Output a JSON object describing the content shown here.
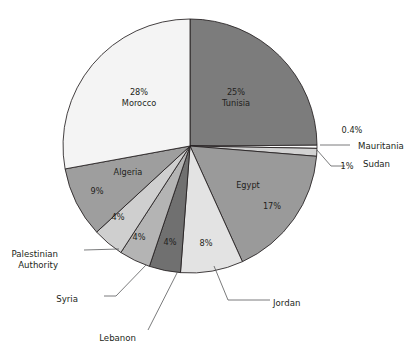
{
  "chart_data": {
    "type": "pie",
    "title": "",
    "subtitle": "",
    "xlabel": "",
    "ylabel": "",
    "legend_position": "none",
    "grid": false,
    "labels_inside": true,
    "total_label": "",
    "categories": [
      "Tunisia",
      "Mauritania",
      "Sudan",
      "Egypt",
      "Jordan",
      "Lebanon",
      "Syria",
      "Palestinian Authority",
      "Algeria",
      "Morocco"
    ],
    "values": [
      25,
      0.4,
      1,
      17,
      8,
      4,
      4,
      4,
      9,
      28
    ],
    "value_labels": [
      "25%",
      "0.4%",
      "1%",
      "17%",
      "8%",
      "4%",
      "4%",
      "4%",
      "9%",
      "28%"
    ],
    "colors": [
      "#7c7c7c",
      "#fbfbfb",
      "#d2d2d2",
      "#9a9a9a",
      "#e3e3e3",
      "#707070",
      "#b4b4b4",
      "#cfcfcf",
      "#9e9e9e",
      "#f4f4f4"
    ],
    "slices": [
      {
        "name": "Tunisia",
        "value": 25,
        "percent_label": "25%",
        "name_label": "Tunisia",
        "color": "#7c7c7c",
        "label_placement": "inside",
        "label_x": 236,
        "label_y": 92,
        "percent_dy": 0,
        "name_dy": 11
      },
      {
        "name": "Mauritania",
        "value": 0.4,
        "percent_label": "0.4%",
        "name_label": "Mauritania",
        "color": "#fbfbfb",
        "label_placement": "callout-right",
        "percent_x": 352,
        "percent_y": 130,
        "name_x": 358,
        "name_y": 146
      },
      {
        "name": "Sudan",
        "value": 1,
        "percent_label": "1%",
        "name_label": "Sudan",
        "color": "#d2d2d2",
        "label_placement": "callout-right",
        "percent_x": 347,
        "percent_y": 166,
        "name_x": 363,
        "name_y": 164
      },
      {
        "name": "Egypt",
        "value": 17,
        "percent_label": "17%",
        "name_label": "Egypt",
        "color": "#9a9a9a",
        "label_placement": "inside",
        "name_x": 248,
        "name_y": 185,
        "percent_x": 272,
        "percent_y": 206
      },
      {
        "name": "Jordan",
        "value": 8,
        "percent_label": "8%",
        "name_label": "Jordan",
        "color": "#e3e3e3",
        "label_placement": "inside-percent-callout-name",
        "percent_x": 206,
        "percent_y": 243,
        "name_x": 273,
        "name_y": 303
      },
      {
        "name": "Lebanon",
        "value": 4,
        "percent_label": "4%",
        "name_label": "Lebanon",
        "color": "#707070",
        "label_placement": "inside-percent-callout-name",
        "percent_x": 170,
        "percent_y": 242,
        "name_x": 136,
        "name_y": 338
      },
      {
        "name": "Syria",
        "value": 4,
        "percent_label": "4%",
        "name_label": "Syria",
        "color": "#b4b4b4",
        "label_placement": "inside-percent-callout-name",
        "percent_x": 139,
        "percent_y": 237,
        "name_x": 78,
        "name_y": 299
      },
      {
        "name": "Palestinian Authority",
        "value": 4,
        "percent_label": "4%",
        "name_label": "Palestinian",
        "name_label_line2": "Authority",
        "color": "#cfcfcf",
        "label_placement": "inside-percent-callout-name",
        "percent_x": 118,
        "percent_y": 217,
        "name_x": 58,
        "name_y": 254
      },
      {
        "name": "Algeria",
        "value": 9,
        "percent_label": "9%",
        "name_label": "Algeria",
        "color": "#9e9e9e",
        "label_placement": "inside",
        "name_x": 128,
        "name_y": 172,
        "percent_x": 97,
        "percent_y": 191
      },
      {
        "name": "Morocco",
        "value": 28,
        "percent_label": "28%",
        "name_label": "Morocco",
        "color": "#f4f4f4",
        "label_placement": "inside",
        "label_x": 139,
        "label_y": 92,
        "percent_dy": 0,
        "name_dy": 11
      }
    ],
    "geometry": {
      "center_x": 190,
      "center_y": 146,
      "radius": 127,
      "start_angle_deg": -90,
      "direction": "clockwise"
    },
    "leaders": [
      {
        "name": "mauritania-leader",
        "points": "320,145 350,145"
      },
      {
        "name": "sudan-leader",
        "points": "317,150 331,166 345,166"
      },
      {
        "name": "jordan-leader",
        "points": "214,266 228,300 270,300"
      },
      {
        "name": "lebanon-leader",
        "points": "178,271 148,330"
      },
      {
        "name": "syria-leader",
        "points": "146,265 116,296 104,296"
      },
      {
        "name": "palestinian-leader",
        "points": "119,249 84,250"
      }
    ]
  }
}
